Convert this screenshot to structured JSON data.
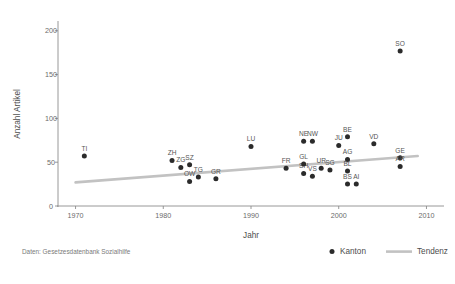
{
  "chart_data": {
    "type": "scatter",
    "title": "",
    "xlabel": "Jahr",
    "ylabel": "Anzahl Artikel",
    "xlim": [
      1968,
      2012
    ],
    "ylim": [
      0,
      210
    ],
    "xticks": [
      1970,
      1980,
      1990,
      2000,
      2010
    ],
    "yticks": [
      0,
      50,
      100,
      150,
      200
    ],
    "grid": false,
    "legend_position": "bottom-right",
    "legend": [
      {
        "label": "Kanton",
        "marker": "dot",
        "color": "#2b2b2b"
      },
      {
        "label": "Tendenz",
        "marker": "line",
        "color": "#c2c2c2"
      }
    ],
    "caption": "Daten: Gesetzesdatenbank Sozialhilfe",
    "series": [
      {
        "name": "Kanton",
        "points": [
          {
            "label": "TI",
            "x": 1971,
            "y": 57
          },
          {
            "label": "ZH",
            "x": 1981,
            "y": 52
          },
          {
            "label": "ZG",
            "x": 1982,
            "y": 44
          },
          {
            "label": "SZ",
            "x": 1983,
            "y": 47
          },
          {
            "label": "OW",
            "x": 1983,
            "y": 28
          },
          {
            "label": "TG",
            "x": 1984,
            "y": 33
          },
          {
            "label": "GR",
            "x": 1986,
            "y": 31
          },
          {
            "label": "LU",
            "x": 1990,
            "y": 68
          },
          {
            "label": "FR",
            "x": 1994,
            "y": 43
          },
          {
            "label": "SH",
            "x": 1996,
            "y": 37
          },
          {
            "label": "NE",
            "x": 1996,
            "y": 74
          },
          {
            "label": "NW",
            "x": 1997,
            "y": 74
          },
          {
            "label": "VS",
            "x": 1997,
            "y": 34
          },
          {
            "label": "GL",
            "x": 1996,
            "y": 48
          },
          {
            "label": "UR",
            "x": 1998,
            "y": 43
          },
          {
            "label": "SG",
            "x": 1999,
            "y": 41
          },
          {
            "label": "JU",
            "x": 2000,
            "y": 69
          },
          {
            "label": "BE",
            "x": 2001,
            "y": 79
          },
          {
            "label": "AG",
            "x": 2001,
            "y": 53
          },
          {
            "label": "BL",
            "x": 2001,
            "y": 40
          },
          {
            "label": "BS",
            "x": 2001,
            "y": 25
          },
          {
            "label": "AI",
            "x": 2002,
            "y": 25
          },
          {
            "label": "VD",
            "x": 2004,
            "y": 71
          },
          {
            "label": "SO",
            "x": 2007,
            "y": 177
          },
          {
            "label": "GE",
            "x": 2007,
            "y": 55
          },
          {
            "label": "AR",
            "x": 2007,
            "y": 45
          }
        ]
      }
    ],
    "trend": {
      "name": "Tendenz",
      "x_start": 1970,
      "y_start": 27,
      "x_end": 2009,
      "y_end": 57
    }
  }
}
